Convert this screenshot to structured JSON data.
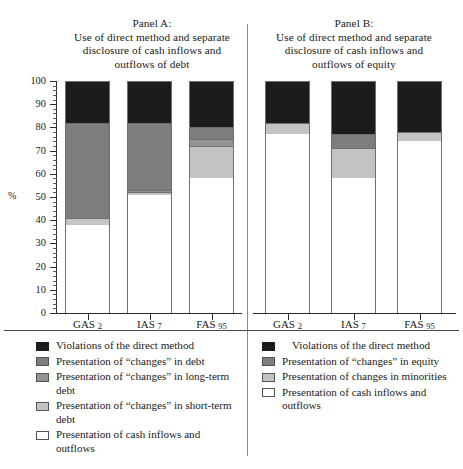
{
  "chart_data": {
    "type": "bar",
    "subtype": "stacked-percentage",
    "title": "",
    "xlabel": "",
    "ylabel": "%",
    "ylim": [
      0,
      100
    ],
    "ytick_labels": [
      "0",
      "10",
      "20",
      "30",
      "40",
      "50",
      "60",
      "70",
      "80",
      "90",
      "100"
    ],
    "ytick_values": [
      0,
      10,
      20,
      30,
      40,
      50,
      60,
      70,
      80,
      90,
      100
    ],
    "ytick_minor_step": 2,
    "grid": false,
    "legend_position": "bottom",
    "panels": [
      {
        "id": "panel-a",
        "label": "Panel A:",
        "title_lines": [
          "Use of direct method and separate",
          "disclosure of cash inflows and",
          "outflows of debt"
        ],
        "categories": [
          "GAS 2",
          "IAS 7",
          "FAS 95"
        ],
        "series": [
          {
            "name": "Violations of the direct method",
            "color": "#1c1c1c",
            "values": [
              18,
              18,
              20
            ]
          },
          {
            "name": "Presentation of \"changes\" in debt",
            "color": "#7d7d7d",
            "values": [
              41,
              29,
              5
            ]
          },
          {
            "name": "Presentation of \"changes\" in long-term debt",
            "color": "#949494",
            "values": [
              0,
              1,
              3
            ]
          },
          {
            "name": "Presentation of \"changes\" in short-term debt",
            "color": "#c3c3c3",
            "values": [
              3,
              1,
              14
            ]
          },
          {
            "name": "Presentation of cash inflows and outflows",
            "color": "#ffffff",
            "values": [
              38,
              51,
              58
            ]
          }
        ]
      },
      {
        "id": "panel-b",
        "label": "Panel B:",
        "title_lines": [
          "Use of direct method and separate",
          "disclosure of cash inflows and",
          "outflows of equity"
        ],
        "categories": [
          "GAS 2",
          "IAS 7",
          "FAS 95"
        ],
        "series": [
          {
            "name": "Violations of the direct method",
            "color": "#1c1c1c",
            "values": [
              18,
              23,
              22
            ]
          },
          {
            "name": "Presentation of \"changes\" in equity",
            "color": "#7d7d7d",
            "values": [
              0,
              6,
              0
            ]
          },
          {
            "name": "Presentation of changes in minorities",
            "color": "#c3c3c3",
            "values": [
              5,
              13,
              4
            ]
          },
          {
            "name": "Presentation of cash inflows and outflows",
            "color": "#ffffff",
            "values": [
              77,
              58,
              74
            ]
          }
        ]
      }
    ]
  },
  "panel_a": {
    "label": "Panel A:",
    "title_line_1": "Use of direct method and separate",
    "title_line_2": "disclosure of cash inflows and",
    "title_line_3": "outflows of debt",
    "x_labels": {
      "c0_name": "GAS",
      "c0_num": "2",
      "c1_name": "IAS",
      "c1_num": "7",
      "c2_name": "FAS",
      "c2_num": "95"
    },
    "legend": [
      {
        "label": "Violations of the direct method",
        "color": "#1c1c1c"
      },
      {
        "label": "Presentation of “changes” in debt",
        "color": "#7d7d7d"
      },
      {
        "label": "Presentation of “changes” in long-term debt",
        "color": "#949494"
      },
      {
        "label": "Presentation of “changes” in short-term debt",
        "color": "#c3c3c3"
      },
      {
        "label": "Presentation of cash inflows and outflows",
        "color": "#ffffff"
      }
    ]
  },
  "panel_b": {
    "label": "Panel B:",
    "title_line_1": "Use of direct method and separate",
    "title_line_2": "disclosure of cash inflows and",
    "title_line_3": "outflows of equity",
    "x_labels": {
      "c0_name": "GAS",
      "c0_num": "2",
      "c1_name": "IAS",
      "c1_num": "7",
      "c2_name": "FAS",
      "c2_num": "95"
    },
    "legend": [
      {
        "label": "Violations of the direct method",
        "color": "#1c1c1c"
      },
      {
        "label": "Presentation of “changes” in equity",
        "color": "#7d7d7d"
      },
      {
        "label": "Presentation of changes in minorities",
        "color": "#c3c3c3"
      },
      {
        "label": "Presentation of cash inflows and outflows",
        "color": "#ffffff"
      }
    ]
  },
  "y_axis": {
    "title": "%",
    "t100": "100",
    "t90": "90",
    "t80": "80",
    "t70": "70",
    "t60": "60",
    "t50": "50",
    "t40": "40",
    "t30": "30",
    "t20": "20",
    "t10": "10",
    "t0": "0"
  }
}
